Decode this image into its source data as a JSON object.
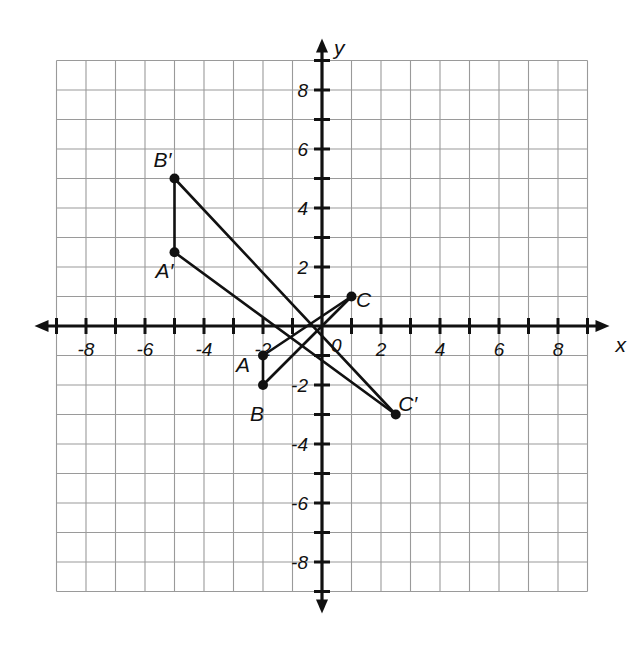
{
  "chart_data": {
    "type": "scatter",
    "title": "",
    "xlabel": "x",
    "ylabel": "y",
    "xlim": [
      -9,
      9
    ],
    "ylim": [
      -9,
      9
    ],
    "grid": true,
    "legend": "none",
    "origin_label": "0",
    "x_tick_labels": [
      "-8",
      "-6",
      "-4",
      "-2",
      "2",
      "4",
      "6",
      "8"
    ],
    "x_tick_values": [
      -8,
      -6,
      -4,
      -2,
      2,
      4,
      6,
      8
    ],
    "y_tick_labels": [
      "8",
      "6",
      "4",
      "2",
      "-2",
      "-4",
      "-6",
      "-8"
    ],
    "y_tick_values": [
      8,
      6,
      4,
      2,
      -2,
      -4,
      -6,
      -8
    ],
    "points": [
      {
        "name": "A",
        "label": "A",
        "x": -2,
        "y": -1,
        "label_dx": -20,
        "label_dy": 16
      },
      {
        "name": "B",
        "label": "B",
        "x": -2,
        "y": -2,
        "label_dx": -6,
        "label_dy": 36
      },
      {
        "name": "C",
        "label": "C",
        "x": 1,
        "y": 1,
        "label_dx": 12,
        "label_dy": 10
      },
      {
        "name": "A-prime",
        "label": "A′",
        "x": -5,
        "y": 2.5,
        "label_dx": -10,
        "label_dy": 26
      },
      {
        "name": "B-prime",
        "label": "B′",
        "x": -5,
        "y": 5,
        "label_dx": -12,
        "label_dy": -12
      },
      {
        "name": "C-prime",
        "label": "C′",
        "x": 2.5,
        "y": -3,
        "label_dx": 12,
        "label_dy": -4
      }
    ],
    "segments": [
      {
        "name": "segment-AB",
        "from": "A",
        "to": "B"
      },
      {
        "name": "segment-BC",
        "from": "B",
        "to": "C"
      },
      {
        "name": "segment-CA",
        "from": "C",
        "to": "A"
      },
      {
        "name": "segment-AprimeBprime",
        "from": "A-prime",
        "to": "B-prime"
      },
      {
        "name": "segment-BprimeCprime",
        "from": "B-prime",
        "to": "C-prime"
      },
      {
        "name": "segment-CprimeAprime",
        "from": "C-prime",
        "to": "A-prime"
      }
    ]
  }
}
